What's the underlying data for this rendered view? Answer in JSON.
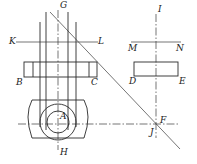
{
  "diagram": {
    "type": "orthographic-projection",
    "labels": {
      "G": "G",
      "K": "K",
      "L": "L",
      "B": "B",
      "C": "C",
      "A": "A",
      "H": "H",
      "I": "I",
      "M": "M",
      "N": "N",
      "D": "D",
      "E": "E",
      "F": "F",
      "J": "J"
    },
    "colors": {
      "line": "#2a2a2a",
      "background": "#ffffff"
    }
  }
}
